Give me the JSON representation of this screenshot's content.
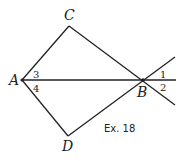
{
  "figure": {
    "caption": "Ex. 18",
    "points": {
      "A": {
        "label": "A",
        "x": 22,
        "y": 80
      },
      "B": {
        "label": "B",
        "x": 143,
        "y": 80
      },
      "C": {
        "label": "C",
        "x": 69,
        "y": 26
      },
      "D": {
        "label": "D",
        "x": 68,
        "y": 136
      }
    },
    "angles": {
      "a1": "1",
      "a2": "2",
      "a3": "3",
      "a4": "4"
    },
    "segments": [
      "AC",
      "CB",
      "AD",
      "DB",
      "AB"
    ],
    "rays_beyond_B": [
      "AB extended",
      "CB extended",
      "DB extended"
    ]
  }
}
